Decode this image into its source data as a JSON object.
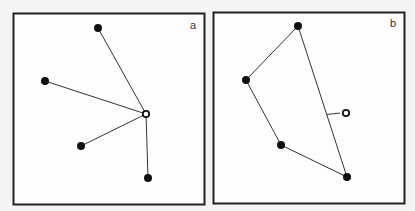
{
  "figure": {
    "panels": [
      {
        "label": "a",
        "description": "Open point connected directly to each of four filled points",
        "filled_points": [
          [
            98,
            28
          ],
          [
            45,
            81
          ],
          [
            81,
            146
          ],
          [
            148,
            178
          ]
        ],
        "open_point": [
          146,
          114
        ]
      },
      {
        "label": "b",
        "description": "Filled points joined as a path; open point connected by perpendicular to nearest segment",
        "filled_points": [
          [
            298,
            26
          ],
          [
            246,
            80
          ],
          [
            281,
            145
          ],
          [
            347,
            177
          ]
        ],
        "open_point": [
          346,
          113
        ]
      }
    ]
  }
}
